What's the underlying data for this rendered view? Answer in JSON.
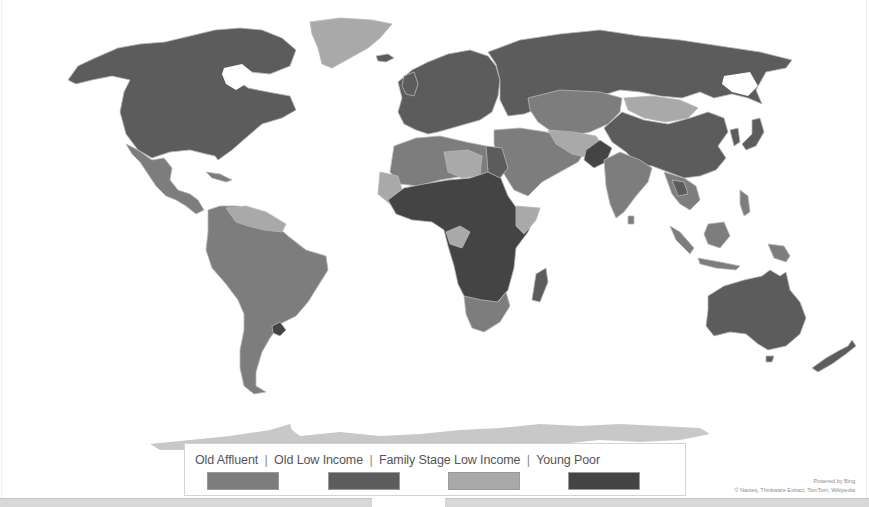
{
  "map": {
    "type": "choropleth-world-map",
    "provider_credit": "Powered by Bing",
    "data_credit": "© Navteq, Thinkware Extract, TomTom, Wikipedia",
    "colors": {
      "old_affluent": "#7d7d7d",
      "old_low_income": "#5c5c5c",
      "family_stage_low_income": "#a9a9a9",
      "young_poor": "#444444",
      "ocean": "#ffffff",
      "antarctica": "#c8c8c8",
      "border": "#b8b8b8"
    }
  },
  "legend": {
    "items": [
      {
        "label": "Old Affluent",
        "color": "#7d7d7d"
      },
      {
        "label": "Old Low Income",
        "color": "#5c5c5c"
      },
      {
        "label": "Family Stage Low Income",
        "color": "#a9a9a9"
      },
      {
        "label": "Young Poor",
        "color": "#444444"
      }
    ],
    "separator": "|"
  },
  "regions": [
    {
      "name": "North America (USA, Canada)",
      "category": "Old Low Income"
    },
    {
      "name": "Greenland",
      "category": "Family Stage Low Income"
    },
    {
      "name": "Mexico & Central America",
      "category": "Old Affluent"
    },
    {
      "name": "South America",
      "category": "Old Affluent"
    },
    {
      "name": "Venezuela / Guianas",
      "category": "Family Stage Low Income"
    },
    {
      "name": "Uruguay",
      "category": "Old Low Income"
    },
    {
      "name": "Europe",
      "category": "Old Low Income"
    },
    {
      "name": "Russia",
      "category": "Old Low Income"
    },
    {
      "name": "Central Asia / Kazakhstan",
      "category": "Old Affluent"
    },
    {
      "name": "Mongolia",
      "category": "Family Stage Low Income"
    },
    {
      "name": "China",
      "category": "Old Low Income"
    },
    {
      "name": "India & South Asia",
      "category": "Old Affluent"
    },
    {
      "name": "Middle East",
      "category": "Old Affluent"
    },
    {
      "name": "North Africa",
      "category": "Old Affluent"
    },
    {
      "name": "Sub-Saharan Africa",
      "category": "Young Poor"
    },
    {
      "name": "Southern Africa",
      "category": "Old Affluent"
    },
    {
      "name": "Madagascar",
      "category": "Old Low Income"
    },
    {
      "name": "Southeast Asia",
      "category": "Old Affluent"
    },
    {
      "name": "Australia",
      "category": "Old Low Income"
    },
    {
      "name": "New Zealand",
      "category": "Old Low Income"
    },
    {
      "name": "Antarctica",
      "category": "none"
    }
  ]
}
